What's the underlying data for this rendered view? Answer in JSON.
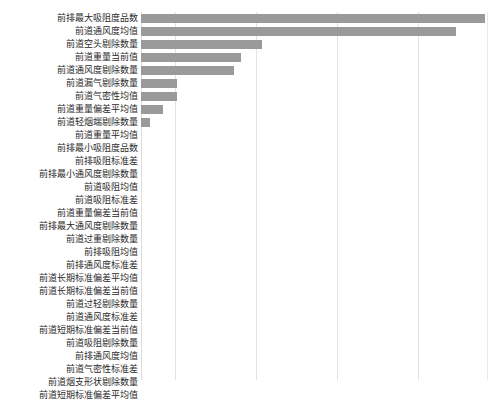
{
  "top_crop_text": "",
  "chart_data": {
    "type": "bar",
    "orientation": "horizontal",
    "title": "",
    "subtitle": "",
    "xlabel": "",
    "ylabel": "",
    "legend": [],
    "legend_position": "none",
    "grid": true,
    "grid_axis": "x",
    "xlim": [
      0,
      1.0
    ],
    "x_tick_values": [
      0,
      0.1,
      0.34,
      0.58,
      0.82,
      1.0
    ],
    "x_tick_labels": [],
    "bar_color": "#9a9a9a",
    "gridline_color": "#e3e3e6",
    "background_color": "#ffffff",
    "categories": [
      "前排最大吸阻度品数",
      "前道通风度均值",
      "前道空头剔除数量",
      "前道重量当前值",
      "前道通风度剔除数量",
      "前道漏气剔除数量",
      "前道气密性均值",
      "前道重量偏差平均值",
      "前道轻烟端剔除数量",
      "前道重量平均值",
      "前排最小吸阻度品数",
      "前排吸阻标准差",
      "前排最小通风度剔除数量",
      "前道吸阻均值",
      "前道吸阻标准差",
      "前道重量偏差当前值",
      "前排最大通风度剔除数量",
      "前道过重剔除数量",
      "前排吸阻均值",
      "前排通风度标准差",
      "前道长期标准偏差平均值",
      "前道长期标准偏差当前值",
      "前道过轻剔除数量",
      "前道通风度标准差",
      "前道短期标准偏差当前值",
      "前道吸阻剔除数量",
      "前排通风度均值",
      "前道气密性标准差",
      "前道烟支形状剔除数量",
      "前道短期标准偏差平均值"
    ],
    "values": [
      1.0,
      0.965,
      0.352,
      0.29,
      0.27,
      0.105,
      0.105,
      0.064,
      0.026,
      0.0,
      0.0,
      0.0,
      0.0,
      0.0,
      0.0,
      0.0,
      0.0,
      0.0,
      0.0,
      0.0,
      0.0,
      0.0,
      0.0,
      0.0,
      0.0,
      0.0,
      0.0,
      0.0,
      0.0,
      0.0
    ],
    "bar_pixel_widths": [
      344,
      315,
      121,
      100,
      93,
      36,
      36,
      22,
      9,
      0,
      0,
      0,
      0,
      0,
      0,
      0,
      0,
      0,
      0,
      0,
      0,
      0,
      0,
      0,
      0,
      0,
      0,
      0,
      0,
      0
    ]
  },
  "layout": {
    "row_height": 13,
    "plot_left": 141,
    "label_right": 138,
    "gridline_x": [
      141,
      175,
      256,
      337,
      418,
      487
    ]
  }
}
